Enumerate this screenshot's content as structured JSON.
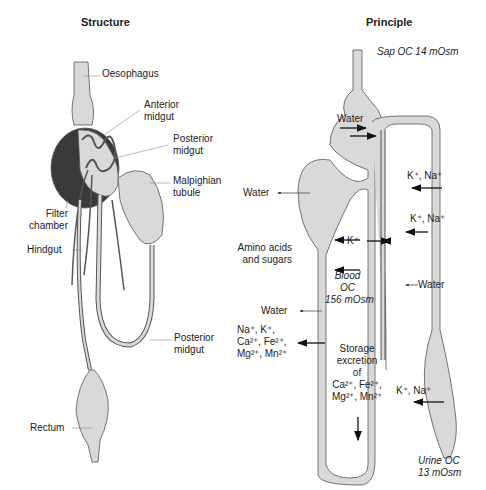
{
  "structure": {
    "title": "Structure",
    "labels": {
      "oesophagus": "Oesophagus",
      "anterior_midgut_1": "Anterior",
      "anterior_midgut_2": "midgut",
      "posterior_midgut_1": "Posterior",
      "posterior_midgut_2": "midgut",
      "malpighian_1": "Malpighian",
      "malpighian_2": "tubule",
      "filter_1": "Filter",
      "filter_2": "chamber",
      "hindgut": "Hindgut",
      "posterior_midgut_lower_1": "Posterior",
      "posterior_midgut_lower_2": "midgut",
      "rectum": "Rectum"
    }
  },
  "principle": {
    "title": "Principle",
    "sap": "Sap OC 14 mOsm",
    "water_top": "Water",
    "k_na_1": "K⁺, Na⁺",
    "k_na_2": "K⁺, Na⁺",
    "water_left": "Water",
    "k_plus": "K⁺",
    "amino_1": "Amino acids",
    "amino_2": "and sugars",
    "water_tubule": "Water",
    "blood_1": "Blood",
    "blood_2": "OC",
    "blood_3": "156 mOsm",
    "water_mid": "Water",
    "ions_1": "Na⁺, K⁺,",
    "ions_2": "Ca²⁺, Fe²⁺,",
    "ions_3": "Mg²⁺, Mn²⁺",
    "storage_1": "Storage",
    "storage_2": "excretion",
    "storage_3": "of",
    "storage_4": "Ca²⁺, Fe²⁺,",
    "storage_5": "Mg²⁺, Mn²⁺",
    "k_na_3": "K⁺, Na⁺",
    "urine_1": "Urine OC",
    "urine_2": "13 mOsm"
  },
  "colors": {
    "fill": "#d9d9d9",
    "dark": "#3a3a3a",
    "stroke": "#555555"
  }
}
